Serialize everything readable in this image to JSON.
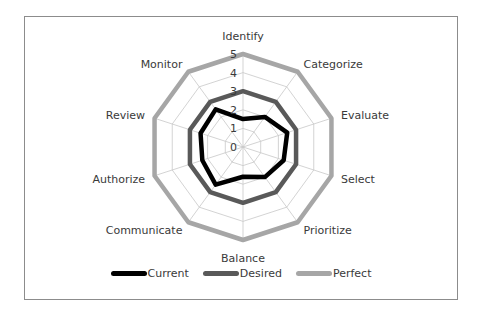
{
  "chart_data": {
    "type": "radar",
    "title": "",
    "categories": [
      "Identify",
      "Categorize",
      "Evaluate",
      "Select",
      "Prioritize",
      "Balance",
      "Communicate",
      "Authorize",
      "Review",
      "Monitor"
    ],
    "series": [
      {
        "name": "Current",
        "color": "#000000",
        "values": [
          1.5,
          2.0,
          2.5,
          2.3,
          2.0,
          1.6,
          2.5,
          2.3,
          2.4,
          2.5
        ]
      },
      {
        "name": "Desired",
        "color": "#595959",
        "values": [
          3,
          3,
          3,
          3,
          3,
          3,
          3,
          3,
          3,
          3
        ]
      },
      {
        "name": "Perfect",
        "color": "#a6a6a6",
        "values": [
          5,
          5,
          5,
          5,
          5,
          5,
          5,
          5,
          5,
          5
        ]
      }
    ],
    "radial_ticks": [
      "0",
      "1",
      "2",
      "3",
      "4",
      "5"
    ],
    "rlim": [
      0,
      5
    ],
    "grid": true,
    "legend_position": "bottom"
  },
  "legend": [
    {
      "label": "Current",
      "color": "#000000"
    },
    {
      "label": "Desired",
      "color": "#595959"
    },
    {
      "label": "Perfect",
      "color": "#a6a6a6"
    }
  ]
}
